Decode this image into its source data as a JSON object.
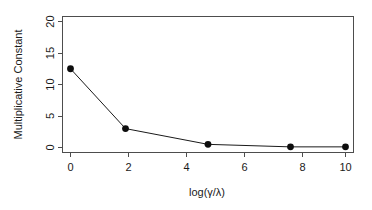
{
  "chart_data": {
    "type": "line",
    "title": "",
    "xlabel": "log(γ/λ)",
    "ylabel": "Multiplicative Constant",
    "x": [
      0,
      2,
      5,
      8,
      10
    ],
    "values": [
      12.5,
      3.0,
      0.5,
      0.1,
      0.1
    ],
    "series": [
      {
        "name": "Multiplicative Constant",
        "x": [
          0,
          2,
          5,
          8,
          10
        ],
        "values": [
          12.5,
          3.0,
          0.5,
          0.1,
          0.1
        ]
      }
    ],
    "xlim": [
      0,
      10
    ],
    "ylim": [
      0,
      20
    ],
    "xticks": [
      0,
      2,
      4,
      6,
      8,
      10
    ],
    "yticks": [
      0,
      5,
      10,
      15,
      20
    ],
    "xtick_labels": [
      "0",
      "2",
      "4",
      "6",
      "8",
      "10"
    ],
    "ytick_labels": [
      "0",
      "5",
      "10",
      "15",
      "20"
    ],
    "grid": false,
    "legend": false,
    "legend_position": "none",
    "marker": "filled-circle",
    "line_color": "#1a1a1a",
    "point_color": "#0d0d0d",
    "axis_color": "#4d4d4d",
    "background_color": "#ffffff"
  },
  "axis_labels": {
    "x_title": "log(γ/λ)",
    "y_title": "Multiplicative Constant"
  },
  "x_ticks": [
    {
      "label": "0",
      "value": 0
    },
    {
      "label": "2",
      "value": 2
    },
    {
      "label": "4",
      "value": 4
    },
    {
      "label": "6",
      "value": 6
    },
    {
      "label": "8",
      "value": 8
    },
    {
      "label": "10",
      "value": 10
    }
  ],
  "y_ticks": [
    {
      "label": "0",
      "value": 0
    },
    {
      "label": "5",
      "value": 5
    },
    {
      "label": "10",
      "value": 10
    },
    {
      "label": "15",
      "value": 15
    },
    {
      "label": "20",
      "value": 20
    }
  ],
  "points": [
    {
      "label": "12.5",
      "x": 0,
      "y": 12.5
    },
    {
      "label": "3.0",
      "x": 2,
      "y": 3.0
    },
    {
      "label": "0.5",
      "x": 5,
      "y": 0.5
    },
    {
      "label": "0.1",
      "x": 8,
      "y": 0.1
    },
    {
      "label": "0.1",
      "x": 10,
      "y": 0.1
    }
  ]
}
